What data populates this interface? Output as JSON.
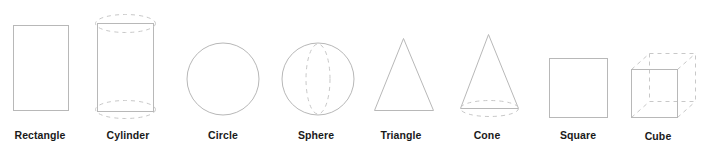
{
  "diagram": {
    "title": "",
    "stroke_color": "#b8b8b8",
    "dash_color": "#c8c8c8",
    "label_color": "#1a1a1a",
    "shapes": [
      {
        "id": "rectangle",
        "label": "Rectangle",
        "kind": "2d"
      },
      {
        "id": "cylinder",
        "label": "Cylinder",
        "kind": "3d"
      },
      {
        "id": "circle",
        "label": "Circle",
        "kind": "2d"
      },
      {
        "id": "sphere",
        "label": "Sphere",
        "kind": "3d"
      },
      {
        "id": "triangle",
        "label": "Triangle",
        "kind": "2d"
      },
      {
        "id": "cone",
        "label": "Cone",
        "kind": "3d"
      },
      {
        "id": "square",
        "label": "Square",
        "kind": "2d"
      },
      {
        "id": "cube",
        "label": "Cube",
        "kind": "3d"
      }
    ]
  }
}
